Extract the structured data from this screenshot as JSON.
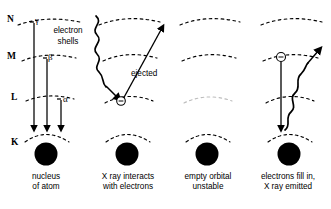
{
  "diagram": {
    "stroke_color": "#000000",
    "nucleus_color": "#000000",
    "shell_arc_style": "dashed",
    "shell_levels": [
      {
        "key": "N",
        "label": "N",
        "y": 22
      },
      {
        "key": "M",
        "label": "M",
        "y": 58
      },
      {
        "key": "L",
        "label": "L",
        "y": 99
      },
      {
        "key": "K",
        "label": "K",
        "y": 140
      }
    ],
    "annotations": {
      "electron_shells_line1": "electron",
      "electron_shells_line2": "shells",
      "gamma": "γ",
      "beta": "β",
      "alpha": "α",
      "ejected": "ejected",
      "electron_symbol": "−"
    },
    "panels": [
      {
        "index": 1,
        "caption_line1": "nucleus",
        "caption_line2": "of atom",
        "nucleus_cx": 46,
        "transitions": [
          "γ",
          "β",
          "α"
        ]
      },
      {
        "index": 2,
        "caption_line1": "X ray interacts",
        "caption_line2": "with electrons",
        "nucleus_cx": 127,
        "incoming_xray": true,
        "ejected_electron": true
      },
      {
        "index": 3,
        "caption_line1": "empty orbital",
        "caption_line2": "unstable",
        "nucleus_cx": 207,
        "l_shell_faded": true
      },
      {
        "index": 4,
        "caption_line1": "electrons fill in,",
        "caption_line2": "X ray emitted",
        "nucleus_cx": 289,
        "electron_drops": true,
        "emitted_xray": true
      }
    ]
  }
}
